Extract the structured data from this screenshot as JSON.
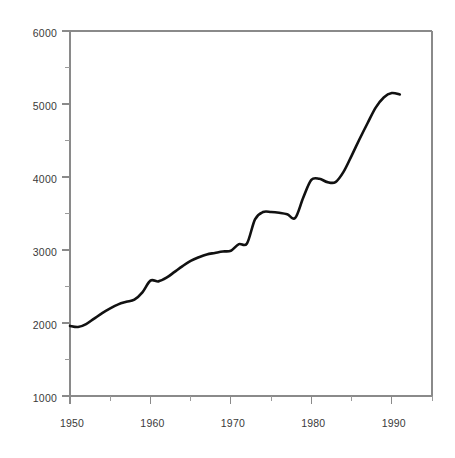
{
  "chart_data": {
    "type": "line",
    "title": "",
    "subtitle": "",
    "xlabel": "",
    "ylabel": "",
    "xlim": [
      1950,
      1995
    ],
    "ylim": [
      1000,
      6000
    ],
    "grid": false,
    "legend": null,
    "annotations": [],
    "x_ticks_major": [
      1950,
      1960,
      1970,
      1980,
      1990
    ],
    "x_tick_labels": [
      "1950",
      "1960",
      "1970",
      "1980",
      "1990"
    ],
    "x_ticks_minor": [
      1955,
      1965,
      1975,
      1985,
      1995
    ],
    "y_ticks_major": [
      1000,
      2000,
      3000,
      4000,
      5000,
      6000
    ],
    "y_tick_labels": [
      "1000",
      "2000",
      "3000",
      "4000",
      "5000",
      "6000"
    ],
    "y_ticks_minor": [
      1500,
      2500,
      3500,
      4500,
      5500
    ],
    "series": [
      {
        "name": "series-1",
        "color": "#111111",
        "x": [
          1950,
          1951,
          1952,
          1953,
          1954,
          1955,
          1956,
          1957,
          1958,
          1959,
          1960,
          1961,
          1962,
          1963,
          1964,
          1965,
          1966,
          1967,
          1968,
          1969,
          1970,
          1971,
          1972,
          1973,
          1974,
          1975,
          1976,
          1977,
          1978,
          1979,
          1980,
          1981,
          1982,
          1983,
          1984,
          1985,
          1986,
          1987,
          1988,
          1989,
          1990,
          1991
        ],
        "values": [
          1960,
          1945,
          1985,
          2060,
          2135,
          2200,
          2255,
          2290,
          2320,
          2420,
          2580,
          2570,
          2620,
          2700,
          2780,
          2850,
          2900,
          2940,
          2960,
          2980,
          2990,
          3080,
          3090,
          3420,
          3520,
          3520,
          3510,
          3490,
          3440,
          3720,
          3960,
          3975,
          3930,
          3930,
          4070,
          4290,
          4520,
          4740,
          4950,
          5090,
          5150,
          5130
        ]
      }
    ]
  },
  "axes": {
    "plot_left_px": 70,
    "plot_right_px": 432,
    "plot_top_px": 31,
    "plot_bottom_px": 396
  }
}
